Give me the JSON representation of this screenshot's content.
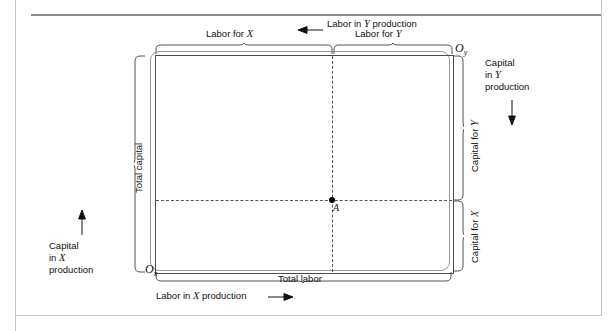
{
  "figure": {
    "type": "edgeworth-production-box",
    "title": ""
  },
  "box": {
    "origin_x_label": "O",
    "origin_x_sub": "x",
    "origin_y_label": "O",
    "origin_y_sub": "y",
    "point_label": "A"
  },
  "labels": {
    "labor_for_x": "Labor for X",
    "labor_for_y": "Labor for Y",
    "labor_in_y_production": "Labor in Y production",
    "labor_in_x_production": "Labor in X production",
    "total_labor": "Total labor",
    "total_capital": "Total capital",
    "capital_for_x": "Capital for X",
    "capital_for_y": "Capital for Y",
    "capital_in_x_production_line1": "Capital",
    "capital_in_x_production_line2": "in X",
    "capital_in_x_production_line3": "production",
    "capital_in_y_production_line1": "Capital",
    "capital_in_y_production_line2": "in Y",
    "capital_in_y_production_line3": "production"
  },
  "icons": {
    "arrow_left": "arrow-left-icon",
    "arrow_right": "arrow-right-icon",
    "arrow_up": "arrow-up-icon",
    "arrow_down": "arrow-down-icon"
  },
  "chart_data": {
    "type": "diagram",
    "box_bounds_px": {
      "left": 155,
      "top": 55,
      "right": 452,
      "bottom": 272
    },
    "allocation_point": {
      "name": "A",
      "x_px": 332,
      "y_px": 200
    },
    "axes": {
      "bottom": "Total labor",
      "left": "Total capital"
    },
    "segments": [
      {
        "name": "Labor for X",
        "side": "top",
        "from_px": 155,
        "to_px": 332
      },
      {
        "name": "Labor for Y",
        "side": "top",
        "from_px": 332,
        "to_px": 452
      },
      {
        "name": "Capital for Y",
        "side": "right",
        "from_px": 55,
        "to_px": 200
      },
      {
        "name": "Capital for X",
        "side": "right",
        "from_px": 200,
        "to_px": 272
      },
      {
        "name": "Total capital",
        "side": "left",
        "from_px": 55,
        "to_px": 272
      },
      {
        "name": "Total labor",
        "side": "bottom",
        "from_px": 155,
        "to_px": 452
      }
    ],
    "direction_arrows": [
      {
        "label": "Labor in X production",
        "direction": "right"
      },
      {
        "label": "Labor in Y production",
        "direction": "left"
      },
      {
        "label": "Capital in X production",
        "direction": "up"
      },
      {
        "label": "Capital in Y production",
        "direction": "down"
      }
    ],
    "colors": {
      "line": "#4a4a4a",
      "dashed": "#555555",
      "text": "#111111"
    }
  }
}
